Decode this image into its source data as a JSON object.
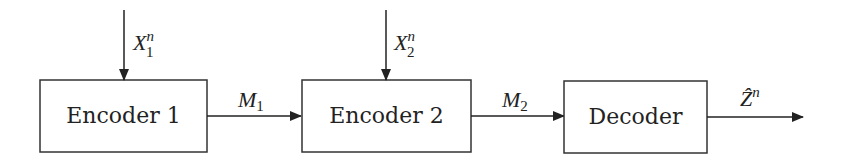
{
  "diagram": {
    "type": "block-diagram",
    "nodes": [
      {
        "id": "encoder1",
        "label": "Encoder 1"
      },
      {
        "id": "encoder2",
        "label": "Encoder 2"
      },
      {
        "id": "decoder",
        "label": "Decoder"
      }
    ],
    "inputs": [
      {
        "to": "encoder1",
        "symbol": "X",
        "sub": "1",
        "sup": "n"
      },
      {
        "to": "encoder2",
        "symbol": "X",
        "sub": "2",
        "sup": "n"
      }
    ],
    "edges": [
      {
        "from": "encoder1",
        "to": "encoder2",
        "symbol": "M",
        "sub": "1"
      },
      {
        "from": "encoder2",
        "to": "decoder",
        "symbol": "M",
        "sub": "2"
      }
    ],
    "output": {
      "from": "decoder",
      "symbol": "Ẑ",
      "sup": "n"
    }
  }
}
